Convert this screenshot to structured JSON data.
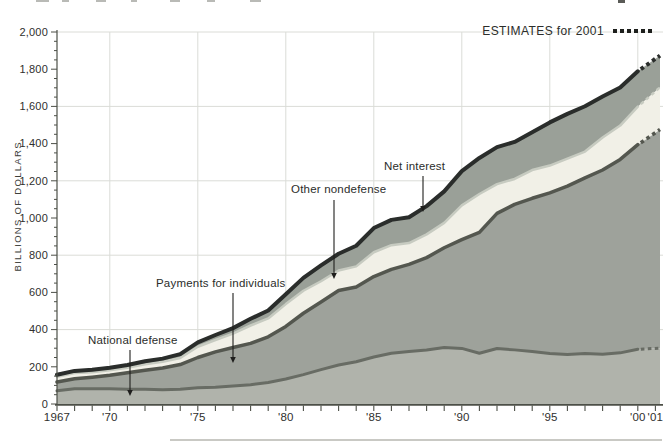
{
  "figure": {
    "y_axis_title": "BILLIONS OF DOLLARS",
    "legend": {
      "label": "ESTIMATES for 2001",
      "marker_count": 6
    },
    "y_ticks": [
      {
        "label": "0",
        "value": 0
      },
      {
        "label": "200",
        "value": 200
      },
      {
        "label": "400",
        "value": 400
      },
      {
        "label": "600",
        "value": 600
      },
      {
        "label": "800",
        "value": 800
      },
      {
        "label": "1,000",
        "value": 1000
      },
      {
        "label": "1,200",
        "value": 1200
      },
      {
        "label": "1,400",
        "value": 1400
      },
      {
        "label": "1,600",
        "value": 1600
      },
      {
        "label": "1,800",
        "value": 1800
      },
      {
        "label": "2,000",
        "value": 2000
      }
    ],
    "x_ticks": [
      {
        "label": "1967",
        "year": 1967
      },
      {
        "label": "'70",
        "year": 1970
      },
      {
        "label": "'75",
        "year": 1975
      },
      {
        "label": "'80",
        "year": 1980
      },
      {
        "label": "'85",
        "year": 1985
      },
      {
        "label": "'90",
        "year": 1990
      },
      {
        "label": "'95",
        "year": 1995
      },
      {
        "label": "'00",
        "year": 2000
      },
      {
        "label": "'01",
        "year": 2001
      }
    ],
    "annotations": [
      {
        "label": "National defense",
        "tx": 88,
        "ty": 334,
        "ax": 130,
        "ay1": 350,
        "ay2": 396
      },
      {
        "label": "Payments for individuals",
        "tx": 156,
        "ty": 277,
        "ax": 233,
        "ay1": 293,
        "ay2": 363
      },
      {
        "label": "Other nondefense",
        "tx": 291,
        "ty": 183,
        "ax": 334,
        "ay1": 200,
        "ay2": 279
      },
      {
        "label": "Net interest",
        "tx": 384,
        "ty": 160,
        "ax": 423,
        "ay1": 176,
        "ay2": 212
      }
    ],
    "artifacts": {
      "top_edge": "cropped illegible text fragments along top edge"
    }
  },
  "chart_data": {
    "type": "area",
    "stacked": true,
    "title": "",
    "xlabel": "",
    "ylabel": "BILLIONS OF DOLLARS",
    "ylim": [
      0,
      2000
    ],
    "y_gridlines": [
      400,
      800,
      1200,
      1600,
      2000
    ],
    "x_gridline_years": [
      1970,
      1975,
      1980,
      1985,
      1990,
      1995,
      2000
    ],
    "y_minor_tick_step": 50,
    "y_major_tick_step": 200,
    "estimate_year": 2001,
    "last_actual_year": 2000,
    "x": [
      1967,
      1968,
      1969,
      1970,
      1971,
      1972,
      1973,
      1974,
      1975,
      1976,
      1977,
      1978,
      1979,
      1980,
      1981,
      1982,
      1983,
      1984,
      1985,
      1986,
      1987,
      1988,
      1989,
      1990,
      1991,
      1992,
      1993,
      1994,
      1995,
      1996,
      1997,
      1998,
      1999,
      2000,
      2001
    ],
    "series": [
      {
        "name": "National defense",
        "color": "#b0b3ab",
        "edge": "#686c64",
        "edge_width": 3,
        "values": [
          71,
          82,
          82,
          82,
          79,
          79,
          77,
          79,
          87,
          90,
          97,
          104,
          116,
          134,
          158,
          185,
          210,
          227,
          253,
          273,
          282,
          290,
          304,
          299,
          273,
          298,
          291,
          282,
          272,
          266,
          271,
          268,
          275,
          294,
          299
        ]
      },
      {
        "name": "Payments for individuals",
        "color": "#9ea29b",
        "edge": "#54574f",
        "edge_width": 3.5,
        "values": [
          47,
          54,
          62,
          72,
          89,
          103,
          117,
          133,
          163,
          190,
          207,
          222,
          245,
          283,
          330,
          363,
          400,
          402,
          432,
          451,
          469,
          497,
          536,
          585,
          650,
          727,
          782,
          824,
          863,
          905,
          945,
          990,
          1040,
          1100,
          1160
        ]
      },
      {
        "name": "Other nondefense",
        "color": "#f1f0e7",
        "edge": "#c7cbc1",
        "edge_width": 2.5,
        "values": [
          29,
          31,
          27,
          27,
          27,
          32,
          33,
          35,
          58,
          64,
          74,
          96,
          99,
          120,
          121,
          112,
          108,
          111,
          131,
          130,
          114,
          125,
          134,
          184,
          206,
          157,
          137,
          152,
          147,
          148,
          141,
          175,
          182,
          205,
          222
        ]
      },
      {
        "name": "Net interest",
        "color": "#9aa098",
        "edge": "#2a2d2b",
        "edge_width": 4,
        "values": [
          10,
          11,
          13,
          14,
          15,
          16,
          17,
          21,
          23,
          27,
          30,
          36,
          43,
          53,
          69,
          85,
          90,
          111,
          130,
          136,
          139,
          152,
          169,
          184,
          194,
          199,
          199,
          203,
          232,
          241,
          244,
          220,
          205,
          190,
          175
        ]
      }
    ]
  }
}
